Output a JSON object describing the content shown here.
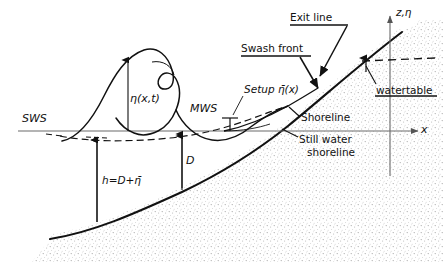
{
  "figure": {
    "type": "coastal-engineering-definition-sketch",
    "background": "#ffffff",
    "ink": "#111111",
    "sand_fill": "#cfcfcf"
  },
  "axes": {
    "vertical_label": "z,η",
    "horizontal_label": "x",
    "origin_x_px": 390,
    "axis_color": "#555555"
  },
  "labels": {
    "sws": "SWS",
    "mws": "MWS",
    "eta_instant": "η(x,t)",
    "setup": "Setup η̄(x)",
    "depth_D": "D",
    "depth_h": "h=D+η̄",
    "swash_front": "Swash front",
    "exit_line": "Exit line",
    "shoreline": "Shoreline",
    "still_water_shoreline_line1": "Still water",
    "still_water_shoreline_line2": "shoreline",
    "watertable": "watertable"
  },
  "underlined_labels": [
    "Exit line",
    "Swash front",
    "watertable"
  ],
  "annotations": [
    {
      "name": "exit-line-leader",
      "from": [
        345,
        22
      ],
      "to": [
        320,
        78
      ]
    },
    {
      "name": "swash-front-leader",
      "from": [
        308,
        55
      ],
      "to": [
        308,
        58
      ]
    },
    {
      "name": "setup-leader",
      "from": [
        245,
        95
      ],
      "to": [
        232,
        118
      ]
    },
    {
      "name": "shoreline-leader",
      "from": [
        300,
        118
      ],
      "to": [
        288,
        105
      ]
    },
    {
      "name": "still-water-shoreline-leader",
      "from": [
        300,
        138
      ],
      "to": [
        283,
        128
      ]
    },
    {
      "name": "watertable-leader",
      "from": [
        378,
        86
      ],
      "to": [
        368,
        62
      ]
    }
  ],
  "features": {
    "sws_line_y_px": 131,
    "wave_crest_px": [
      148,
      50
    ],
    "wave_toe_px": [
      62,
      141
    ],
    "shoreline_px": [
      288,
      106
    ],
    "still_water_shoreline_px": [
      281,
      131
    ],
    "watertable_dash_y_px": 60,
    "seabed_left_px": [
      50,
      239
    ],
    "beach_top_right_px": [
      402,
      32
    ]
  }
}
